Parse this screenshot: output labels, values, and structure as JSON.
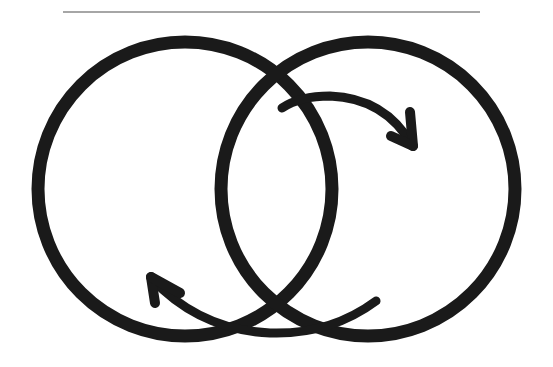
{
  "diagram": {
    "description": "Two overlapping circles with curved arrows indicating cyclic exchange between them",
    "colors": {
      "background": "#ffffff",
      "stroke": "#1a1a1a",
      "rule": "#a6a6a6"
    },
    "rule": {
      "x1": 63,
      "x2": 480,
      "y": 12,
      "width": 2
    },
    "circles": [
      {
        "id": "left",
        "cx": 185,
        "cy": 189,
        "r": 147,
        "stroke_width": 13
      },
      {
        "id": "right",
        "cx": 368,
        "cy": 189,
        "r": 147,
        "stroke_width": 13
      }
    ],
    "arrows": [
      {
        "id": "top-arrow",
        "direction": "left-to-right",
        "path": "M282,108 Q300,96 330,96 Q385,98 412,145",
        "head": [
          "M410,112 L413,146",
          "M391,136 L413,146"
        ]
      },
      {
        "id": "bottom-arrow",
        "direction": "right-to-left",
        "path": "M376,301 Q330,335 270,333 Q200,330 152,279",
        "head": [
          "M151,277 L155,303",
          "M151,277 L180,293"
        ]
      }
    ],
    "arrow_stroke_width": 9
  }
}
